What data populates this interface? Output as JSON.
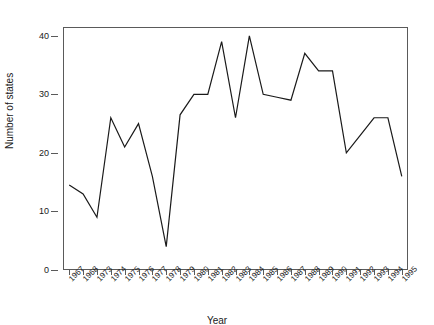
{
  "chart_data": {
    "type": "line",
    "title": "",
    "xlabel": "Year",
    "ylabel": "Number of states",
    "categories": [
      "1967",
      "1968",
      "1973",
      "1974",
      "1975",
      "1976",
      "1977",
      "1978",
      "1979",
      "1980",
      "1981",
      "1982",
      "1983",
      "1984",
      "1985",
      "1986",
      "1987",
      "1988",
      "1989",
      "1990",
      "1991",
      "1992",
      "1993",
      "1994",
      "1995"
    ],
    "values": [
      14.5,
      13,
      9,
      26,
      21,
      25,
      16,
      4,
      26.5,
      30,
      30,
      39,
      26,
      40,
      30,
      29.5,
      29,
      37,
      34,
      34,
      20,
      23,
      26,
      26,
      16
    ],
    "ylim": [
      0,
      41.5
    ],
    "yticks": [
      "0",
      "10",
      "20",
      "30",
      "40"
    ],
    "ytick_values": [
      0,
      10,
      20,
      30,
      40
    ],
    "grid": false,
    "legend": "none",
    "line_color": "#1a1a1a",
    "frame_color": "#5a5a5a",
    "background": "#ffffff"
  }
}
